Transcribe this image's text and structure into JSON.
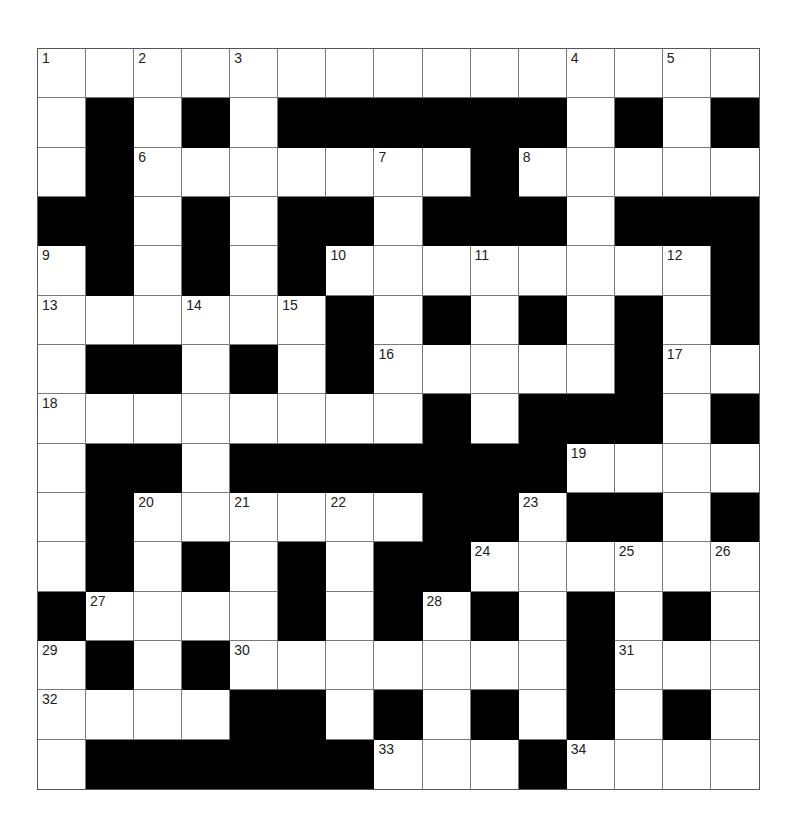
{
  "puzzle": {
    "rows": 15,
    "cols": 15,
    "colors": {
      "black": "#000000",
      "white": "#ffffff",
      "gridline": "#7a7a7a"
    },
    "layout": [
      "WWWWWWWWWWWWWWW",
      "WBWBWBBBBBBWBWB",
      "WBWWWWWWWBWWWWW",
      "BBWBWBBWBBBWBBB",
      "WBWBWBWWWWWWWWB",
      "WWWWWWBWBWBWBWB",
      "WBBWBWBWWWWWBWW",
      "WWWWWWWWBWBBBWB",
      "WBBWBBBBBBBWWWW",
      "WBWWWWWWBBWBBWB",
      "WBWBWBWBBWWWWWW",
      "BWWWWBWBWBWBWBW",
      "WBWBWWWWWWWBWWW",
      "WWWWBBWBWBWBWBW",
      "WBBBBBBWWWBWWWW"
    ],
    "numbers": [
      {
        "r": 0,
        "c": 0,
        "n": "1"
      },
      {
        "r": 0,
        "c": 2,
        "n": "2"
      },
      {
        "r": 0,
        "c": 4,
        "n": "3"
      },
      {
        "r": 0,
        "c": 11,
        "n": "4"
      },
      {
        "r": 0,
        "c": 13,
        "n": "5"
      },
      {
        "r": 2,
        "c": 2,
        "n": "6"
      },
      {
        "r": 2,
        "c": 7,
        "n": "7"
      },
      {
        "r": 2,
        "c": 10,
        "n": "8"
      },
      {
        "r": 4,
        "c": 0,
        "n": "9"
      },
      {
        "r": 4,
        "c": 6,
        "n": "10"
      },
      {
        "r": 4,
        "c": 9,
        "n": "11"
      },
      {
        "r": 4,
        "c": 13,
        "n": "12"
      },
      {
        "r": 5,
        "c": 0,
        "n": "13"
      },
      {
        "r": 5,
        "c": 3,
        "n": "14"
      },
      {
        "r": 5,
        "c": 5,
        "n": "15"
      },
      {
        "r": 6,
        "c": 7,
        "n": "16"
      },
      {
        "r": 6,
        "c": 13,
        "n": "17"
      },
      {
        "r": 7,
        "c": 0,
        "n": "18"
      },
      {
        "r": 8,
        "c": 11,
        "n": "19"
      },
      {
        "r": 9,
        "c": 2,
        "n": "20"
      },
      {
        "r": 9,
        "c": 4,
        "n": "21"
      },
      {
        "r": 9,
        "c": 6,
        "n": "22"
      },
      {
        "r": 9,
        "c": 10,
        "n": "23"
      },
      {
        "r": 10,
        "c": 9,
        "n": "24"
      },
      {
        "r": 10,
        "c": 12,
        "n": "25"
      },
      {
        "r": 10,
        "c": 14,
        "n": "26"
      },
      {
        "r": 11,
        "c": 1,
        "n": "27"
      },
      {
        "r": 11,
        "c": 8,
        "n": "28"
      },
      {
        "r": 12,
        "c": 0,
        "n": "29"
      },
      {
        "r": 12,
        "c": 4,
        "n": "30"
      },
      {
        "r": 12,
        "c": 12,
        "n": "31"
      },
      {
        "r": 13,
        "c": 0,
        "n": "32"
      },
      {
        "r": 14,
        "c": 7,
        "n": "33"
      },
      {
        "r": 14,
        "c": 11,
        "n": "34"
      }
    ],
    "entries": {}
  }
}
